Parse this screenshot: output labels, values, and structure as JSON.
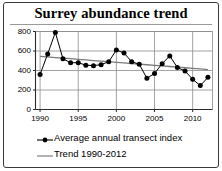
{
  "chart_data": {
    "type": "line",
    "title": "Surrey abundance trend",
    "xlabel": "",
    "ylabel": "",
    "xlim": [
      1989.4,
      2012.6
    ],
    "ylim": [
      0,
      800
    ],
    "grid": true,
    "legend_position": "bottom-left",
    "y_ticks": [
      0,
      200,
      400,
      600,
      800
    ],
    "y_tick_labels": [
      "0",
      "200",
      "400",
      "600",
      "800"
    ],
    "x_ticks": [
      1990,
      1995,
      2000,
      2005,
      2010
    ],
    "x_tick_labels": [
      "1990",
      "1995",
      "2000",
      "2005",
      "2010"
    ],
    "x": [
      1990,
      1991,
      1992,
      1993,
      1994,
      1995,
      1996,
      1997,
      1998,
      1999,
      2000,
      2001,
      2002,
      2003,
      2004,
      2005,
      2006,
      2007,
      2008,
      2009,
      2010,
      2011,
      2012
    ],
    "series": [
      {
        "name": "Average annual transect index",
        "marker": "circle",
        "color": "#000000",
        "values": [
          360,
          570,
          790,
          520,
          480,
          480,
          455,
          450,
          460,
          490,
          610,
          580,
          490,
          465,
          320,
          370,
          470,
          550,
          430,
          395,
          310,
          245,
          330
        ]
      },
      {
        "name": "Trend 1990-2012",
        "marker": "none",
        "color": "#7a7a7a",
        "values": [
          545,
          539,
          533,
          527,
          521,
          515,
          508,
          502,
          496,
          490,
          484,
          478,
          471,
          465,
          459,
          453,
          447,
          441,
          434,
          428,
          422,
          416,
          410
        ]
      }
    ],
    "legend": [
      {
        "label": "Average annual transect index",
        "key": "line-with-marker"
      },
      {
        "label": "Trend 1990-2012",
        "key": "line"
      }
    ]
  }
}
